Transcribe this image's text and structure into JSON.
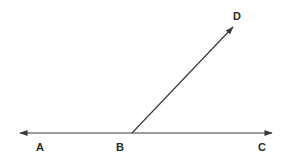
{
  "diagram": {
    "type": "geometry-angle",
    "line_color": "#3a3a3a",
    "points": {
      "A": {
        "label": "A"
      },
      "B": {
        "label": "B"
      },
      "C": {
        "label": "C"
      },
      "D": {
        "label": "D"
      }
    },
    "lines": [
      {
        "name": "line-AC",
        "description": "Line through A, B, C with arrows at both ends"
      },
      {
        "name": "ray-BD",
        "description": "Ray from B through D with arrow at D"
      }
    ]
  }
}
